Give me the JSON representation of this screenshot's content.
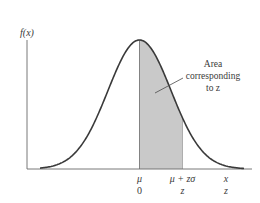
{
  "figure": {
    "y_axis_label": "f(x)",
    "annotation": {
      "line1": "Area",
      "line2": "corresponding",
      "line3": "to z"
    },
    "x_labels_top": {
      "mean": "μ",
      "upper": "μ + zσ",
      "var": "x"
    },
    "x_labels_bottom": {
      "mean": "0",
      "upper": "z",
      "var": "z"
    },
    "colors": {
      "curve": "#3a3a3a",
      "axis": "#6a6a6a",
      "shade": "#c9c9c9",
      "text": "#3a3a3a"
    }
  },
  "chart_data": {
    "type": "area",
    "title": "",
    "xlabel": "x",
    "ylabel": "f(x)",
    "curve": "normal",
    "mean_label": "μ",
    "shaded_region": {
      "from": "μ",
      "to": "μ + zσ",
      "from_z": 0,
      "to_z": "z"
    },
    "annotation": "Area corresponding to z",
    "axis_scales": [
      {
        "axis": "x",
        "labels": [
          "μ",
          "μ + zσ",
          "x"
        ]
      },
      {
        "axis": "z",
        "labels": [
          "0",
          "z",
          "z"
        ]
      }
    ],
    "grid": false,
    "legend": null
  }
}
